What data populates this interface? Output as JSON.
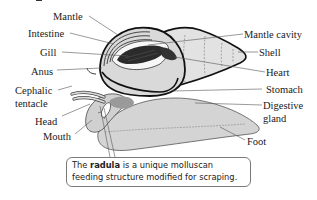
{
  "figure": {
    "type": "anatomical-diagram",
    "labels_left": [
      {
        "id": "mantle",
        "text": "Mantle"
      },
      {
        "id": "intestine",
        "text": "Intestine"
      },
      {
        "id": "gill",
        "text": "Gill"
      },
      {
        "id": "anus",
        "text": "Anus"
      },
      {
        "id": "cephalic-tentacle",
        "text": "Cephalic",
        "text2": "tentacle"
      },
      {
        "id": "head",
        "text": "Head"
      },
      {
        "id": "mouth",
        "text": "Mouth"
      }
    ],
    "labels_right": [
      {
        "id": "mantle-cavity",
        "text": "Mantle cavity"
      },
      {
        "id": "shell",
        "text": "Shell"
      },
      {
        "id": "heart",
        "text": "Heart"
      },
      {
        "id": "stomach",
        "text": "Stomach"
      },
      {
        "id": "digestive-gland",
        "text": "Digestive",
        "text2": "gland"
      },
      {
        "id": "foot",
        "text": "Foot"
      }
    ],
    "callout": {
      "pre": "The ",
      "bold": "radula",
      "post": " is a unique molluscan feeding structure modified for scraping."
    },
    "colors": {
      "body_fill": "#d6d6d6",
      "shell_fill": "#e2e2e2",
      "gill_fill": "#2b2b2b",
      "outline": "#111111",
      "leader": "#555555",
      "gland_fill": "#9a9a9a"
    }
  }
}
